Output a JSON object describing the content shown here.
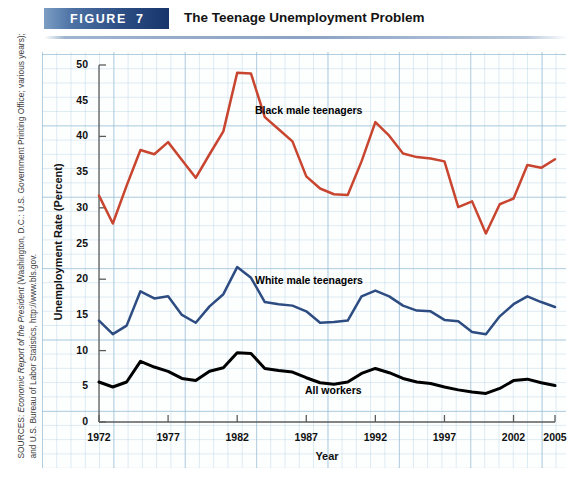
{
  "figure": {
    "badge_label": "FIGURE",
    "badge_number": "7",
    "title": "The Teenage Unemployment Problem"
  },
  "sources": {
    "prefix": "SOURCES: ",
    "italic_part": "Economic Report of the President",
    "rest": " (Washington, D.C.: U.S. Government Printing Office; various years); and U.S. Bureau of Labor Statistics, http://www.bls.gov."
  },
  "chart_data": {
    "type": "line",
    "title": "The Teenage Unemployment Problem",
    "xlabel": "Year",
    "ylabel": "Unemployment Rate (Percent)",
    "xlim": [
      1972,
      2005
    ],
    "ylim": [
      0,
      50
    ],
    "ytick_step": 5,
    "yticks": [
      "0",
      "5",
      "10",
      "15",
      "20",
      "25",
      "30",
      "35",
      "40",
      "45",
      "50"
    ],
    "xticks": [
      "1972",
      "1977",
      "1982",
      "1987",
      "1992",
      "1997",
      "2002",
      "2005"
    ],
    "grid": true,
    "legend": "inline-labels",
    "x": [
      1972,
      1973,
      1974,
      1975,
      1976,
      1977,
      1978,
      1979,
      1980,
      1981,
      1982,
      1983,
      1984,
      1985,
      1986,
      1987,
      1988,
      1989,
      1990,
      1991,
      1992,
      1993,
      1994,
      1995,
      1996,
      1997,
      1998,
      1999,
      2000,
      2001,
      2002,
      2003,
      2004,
      2005
    ],
    "series": [
      {
        "name": "Black male teenagers",
        "color": "#c8452f",
        "values": [
          31.7,
          27.8,
          33.1,
          38.1,
          37.5,
          39.2,
          36.7,
          34.2,
          37.5,
          40.7,
          48.9,
          48.8,
          42.7,
          41.0,
          39.3,
          34.4,
          32.7,
          31.9,
          31.8,
          36.5,
          42.0,
          40.1,
          37.6,
          37.1,
          36.9,
          36.5,
          30.1,
          30.9,
          26.4,
          30.5,
          31.3,
          36.0,
          35.6,
          36.8
        ]
      },
      {
        "name": "White male teenagers",
        "color": "#2d4c82",
        "values": [
          14.2,
          12.3,
          13.5,
          18.3,
          17.3,
          17.6,
          15.0,
          13.9,
          16.2,
          17.9,
          21.7,
          20.2,
          16.8,
          16.5,
          16.3,
          15.5,
          13.9,
          14.0,
          14.2,
          17.6,
          18.4,
          17.6,
          16.3,
          15.6,
          15.5,
          14.3,
          14.1,
          12.6,
          12.3,
          14.8,
          16.5,
          17.6,
          16.8,
          16.1
        ]
      },
      {
        "name": "All workers",
        "color": "#000000",
        "values": [
          5.6,
          4.9,
          5.6,
          8.5,
          7.7,
          7.1,
          6.1,
          5.8,
          7.1,
          7.6,
          9.7,
          9.6,
          7.5,
          7.2,
          7.0,
          6.2,
          5.5,
          5.3,
          5.6,
          6.8,
          7.5,
          6.9,
          6.1,
          5.6,
          5.4,
          4.9,
          4.5,
          4.2,
          4.0,
          4.7,
          5.8,
          6.0,
          5.5,
          5.1
        ]
      }
    ]
  }
}
